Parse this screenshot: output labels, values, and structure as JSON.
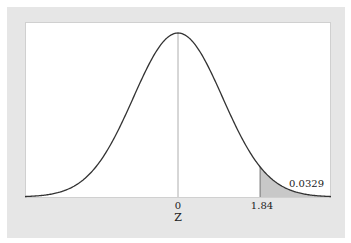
{
  "chart_data": {
    "type": "area",
    "title": "",
    "xlabel": "Z",
    "ylabel": "",
    "distribution": "Standard Normal",
    "x_ticks": [
      {
        "value": 0,
        "label": "0"
      },
      {
        "value": 1.84,
        "label": "1.84"
      }
    ],
    "xlim": [
      -3.43,
      3.43
    ],
    "shaded_region": {
      "from": 1.84,
      "to": 3.43,
      "area": 0.0329,
      "label": "0.0329"
    },
    "center_line": 0,
    "grid": false,
    "legend": null,
    "colors": {
      "curve": "#333333",
      "shade": "#c8c8c8",
      "center_line": "#999999",
      "frame": "#e6e6e6"
    }
  },
  "labels": {
    "tick_0": "0",
    "tick_1": "1.84",
    "axis_title": "Z",
    "area_value": "0.0329"
  }
}
